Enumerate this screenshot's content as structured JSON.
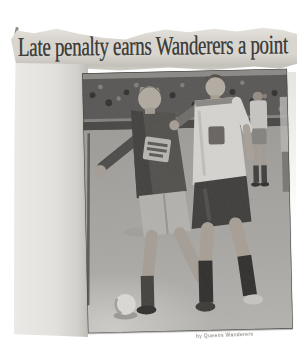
{
  "clipping": {
    "headline": "Late penalty earns Wanderers a point",
    "photo": {
      "description": "Black-and-white action photo: two footballers challenge for the ball in front of a crowded terrace",
      "caption": "by Queens Wanderers",
      "elements": [
        "crowd-terrace",
        "home-player-dark-kit",
        "away-player-white-kit",
        "background-player",
        "football",
        "goal-post"
      ]
    },
    "colors": {
      "scan_background": "#ffffff",
      "newsprint_paper": "#d8d5ce",
      "paper_margin": "#e4e3df",
      "headline_ink": "#3f3e3c",
      "photo_crowd_band": "#565553",
      "photo_grass": "#a9a7a3",
      "kit_dark": "#504e4b",
      "kit_white": "#d8d6d2"
    }
  }
}
